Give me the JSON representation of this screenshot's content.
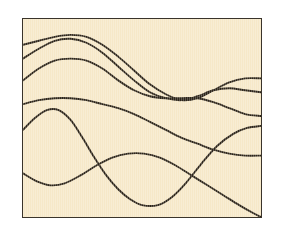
{
  "figure": {
    "title": "",
    "caption": "",
    "background_color": "#ffffff",
    "panel_background_color": "#f6e8c8",
    "panel_border_color": "#3a342b",
    "curve_color": "#2c2419"
  },
  "chart_data": {
    "type": "line",
    "title": "",
    "subtitle": "",
    "xlabel": "",
    "ylabel": "",
    "xlim": [
      0,
      240
    ],
    "ylim": [
      0,
      200
    ],
    "grid": false,
    "legend": "none",
    "axis_ticks": [],
    "annotations": [],
    "note": "Six smooth wavy curves drawn across a cream rectangular panel; curves weave and intersect. Coordinates are in panel-local pixels, origin at panel top-left, y increasing downward.",
    "series": [
      {
        "name": "curve-1",
        "stroke": "#2c2419",
        "points": [
          [
            0,
            26
          ],
          [
            16,
            22
          ],
          [
            32,
            18
          ],
          [
            48,
            16
          ],
          [
            64,
            18
          ],
          [
            80,
            26
          ],
          [
            96,
            38
          ],
          [
            112,
            52
          ],
          [
            128,
            66
          ],
          [
            144,
            76
          ],
          [
            160,
            82
          ],
          [
            176,
            80
          ],
          [
            192,
            72
          ],
          [
            208,
            64
          ],
          [
            224,
            60
          ],
          [
            240,
            60
          ]
        ]
      },
      {
        "name": "curve-2",
        "stroke": "#2c2419",
        "points": [
          [
            0,
            40
          ],
          [
            16,
            30
          ],
          [
            32,
            22
          ],
          [
            48,
            20
          ],
          [
            64,
            24
          ],
          [
            80,
            34
          ],
          [
            96,
            48
          ],
          [
            112,
            62
          ],
          [
            128,
            74
          ],
          [
            144,
            80
          ],
          [
            160,
            82
          ],
          [
            176,
            78
          ],
          [
            192,
            72
          ],
          [
            208,
            70
          ],
          [
            224,
            72
          ],
          [
            240,
            74
          ]
        ]
      },
      {
        "name": "curve-3",
        "stroke": "#2c2419",
        "points": [
          [
            0,
            62
          ],
          [
            16,
            50
          ],
          [
            32,
            42
          ],
          [
            48,
            40
          ],
          [
            64,
            42
          ],
          [
            80,
            50
          ],
          [
            96,
            62
          ],
          [
            112,
            72
          ],
          [
            128,
            78
          ],
          [
            144,
            80
          ],
          [
            160,
            80
          ],
          [
            176,
            80
          ],
          [
            192,
            84
          ],
          [
            208,
            90
          ],
          [
            224,
            96
          ],
          [
            240,
            98
          ]
        ]
      },
      {
        "name": "curve-4",
        "stroke": "#2c2419",
        "points": [
          [
            0,
            86
          ],
          [
            16,
            82
          ],
          [
            32,
            80
          ],
          [
            48,
            80
          ],
          [
            64,
            82
          ],
          [
            80,
            86
          ],
          [
            96,
            90
          ],
          [
            112,
            96
          ],
          [
            128,
            104
          ],
          [
            144,
            112
          ],
          [
            160,
            120
          ],
          [
            176,
            126
          ],
          [
            192,
            132
          ],
          [
            208,
            136
          ],
          [
            224,
            138
          ],
          [
            240,
            138
          ]
        ]
      },
      {
        "name": "curve-5",
        "stroke": "#2c2419",
        "points": [
          [
            0,
            112
          ],
          [
            12,
            100
          ],
          [
            24,
            92
          ],
          [
            36,
            92
          ],
          [
            48,
            102
          ],
          [
            60,
            120
          ],
          [
            72,
            140
          ],
          [
            84,
            158
          ],
          [
            96,
            172
          ],
          [
            108,
            182
          ],
          [
            120,
            188
          ],
          [
            136,
            188
          ],
          [
            150,
            180
          ],
          [
            164,
            166
          ],
          [
            180,
            146
          ],
          [
            196,
            128
          ],
          [
            212,
            116
          ],
          [
            226,
            110
          ],
          [
            240,
            108
          ]
        ]
      },
      {
        "name": "curve-6",
        "stroke": "#2c2419",
        "points": [
          [
            0,
            156
          ],
          [
            14,
            164
          ],
          [
            28,
            168
          ],
          [
            42,
            166
          ],
          [
            58,
            158
          ],
          [
            74,
            148
          ],
          [
            90,
            140
          ],
          [
            106,
            136
          ],
          [
            122,
            136
          ],
          [
            138,
            140
          ],
          [
            154,
            148
          ],
          [
            170,
            158
          ],
          [
            186,
            168
          ],
          [
            202,
            178
          ],
          [
            218,
            188
          ],
          [
            232,
            196
          ],
          [
            240,
            200
          ]
        ]
      }
    ]
  }
}
